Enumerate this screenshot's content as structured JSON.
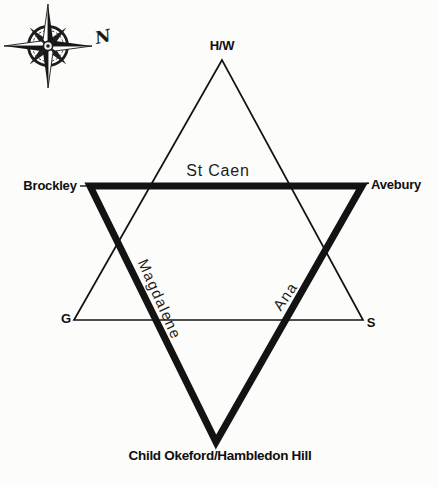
{
  "diagram": {
    "compass": {
      "north": "N"
    },
    "vertices": {
      "top": "H/W",
      "left": "Brockley",
      "right": "Avebury",
      "bottom_left": "G",
      "bottom_right": "S",
      "bottom": "Child Okeford/Hambledon Hill"
    },
    "edges": {
      "st_caen": "St Caen",
      "magdalene": "Magdalene",
      "ana": "Ana"
    },
    "colors": {
      "line": "#131313",
      "background": "#fcfcfb"
    }
  }
}
